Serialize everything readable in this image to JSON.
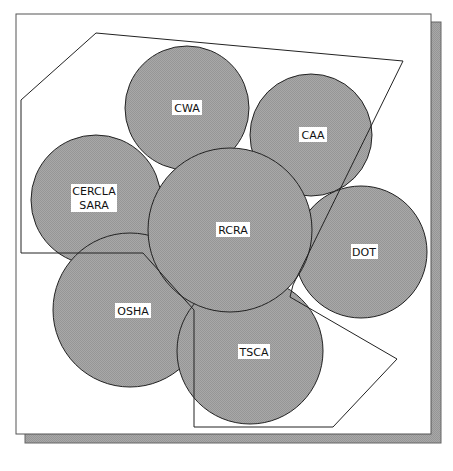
{
  "diagram": {
    "type": "overlapping-circles-venn",
    "colors": {
      "background": "#ffffff",
      "frame_fill": "#ffffff",
      "frame_stroke": "#555555",
      "shadow_fill": "#9a9a9a",
      "circle_fill": "#a3a3a3",
      "circle_stroke": "#222222",
      "polygon_stroke": "#222222",
      "label_bg": "#ffffff",
      "label_text": "#111111"
    },
    "circles": [
      {
        "id": "cwa",
        "lines": [
          "CWA"
        ],
        "cx": 187,
        "cy": 108,
        "r": 62
      },
      {
        "id": "caa",
        "lines": [
          "CAA"
        ],
        "cx": 311,
        "cy": 135,
        "r": 61
      },
      {
        "id": "cercla-sara",
        "lines": [
          "CERCLA",
          "SARA"
        ],
        "cx": 96,
        "cy": 200,
        "r": 65
      },
      {
        "id": "dot",
        "lines": [
          "DOT"
        ],
        "cx": 361,
        "cy": 252,
        "r": 66
      },
      {
        "id": "osha",
        "lines": [
          "OSHA"
        ],
        "cx": 130,
        "cy": 310,
        "r": 77
      },
      {
        "id": "tsca",
        "lines": [
          "TSCA"
        ],
        "cx": 250,
        "cy": 351,
        "r": 73
      },
      {
        "id": "rcra",
        "lines": [
          "RCRA"
        ],
        "cx": 230,
        "cy": 230,
        "r": 82
      }
    ],
    "labels": {
      "cwa": "CWA",
      "caa": "CAA",
      "cercla_line1": "CERCLA",
      "cercla_line2": "SARA",
      "rcra": "RCRA",
      "dot": "DOT",
      "osha": "OSHA",
      "tsca": "TSCA"
    },
    "boundary_polygon": "21,100 96,33 403,61 293,285 290,297 397,359 333,427 194,427 194,310 143,253 21,253"
  }
}
